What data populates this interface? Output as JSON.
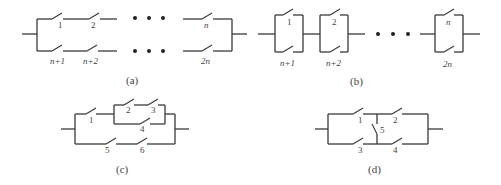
{
  "figure": {
    "panels": [
      {
        "id": "a",
        "caption": "(a)",
        "description": "Two parallel branches, each a series chain of n switches",
        "top_labels": [
          "1",
          "2",
          "n"
        ],
        "bottom_labels": [
          "n+1",
          "n+2",
          "2n"
        ],
        "ellipsis": "..."
      },
      {
        "id": "b",
        "caption": "(b)",
        "description": "Series chain of n parallel switch pairs",
        "top_labels": [
          "1",
          "2",
          "n"
        ],
        "bottom_labels": [
          "n+1",
          "n+2",
          "2n"
        ],
        "ellipsis": "..."
      },
      {
        "id": "c",
        "caption": "(c)",
        "description": "Switch 1 in series with (2-3 series parallel to 4), all parallel to 5-6 series",
        "labels": [
          "1",
          "2",
          "3",
          "4",
          "5",
          "6"
        ]
      },
      {
        "id": "d",
        "caption": "(d)",
        "description": "Bridge network: 1-2 top, 3-4 bottom, 5 bridge",
        "labels": [
          "1",
          "2",
          "3",
          "4",
          "5"
        ]
      }
    ]
  }
}
